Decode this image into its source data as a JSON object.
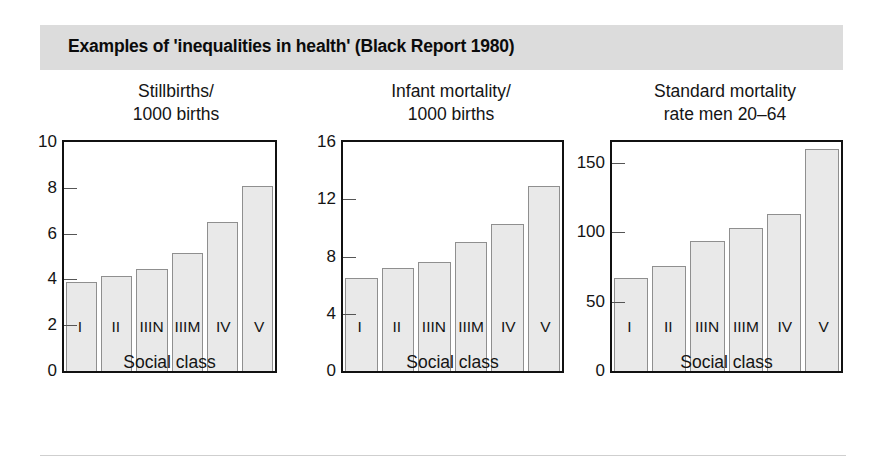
{
  "header": {
    "title": "Examples of 'inequalities in health' (Black Report 1980)",
    "band_color": "#dcdcdc"
  },
  "axis_caption": "Social class",
  "chart_data": [
    {
      "type": "bar",
      "title": "Stillbirths/\n1000 births",
      "title_line1": "Stillbirths/",
      "title_line2": "1000 births",
      "xlabel": "Social class",
      "ylabel": "",
      "categories": [
        "I",
        "II",
        "IIIN",
        "IIIM",
        "IV",
        "V"
      ],
      "values": [
        3.9,
        4.15,
        4.45,
        5.15,
        6.5,
        8.1
      ],
      "ylim": [
        0,
        10
      ],
      "yticks": [
        0,
        2,
        4,
        6,
        8,
        10
      ],
      "ytick_labels": [
        "0",
        "2",
        "4",
        "6",
        "8",
        "10"
      ],
      "grid": false,
      "legend": "none",
      "bar_fill": "#e9e9e9",
      "bar_border": "#8f8f8f"
    },
    {
      "type": "bar",
      "title": "Infant mortality/\n1000 births",
      "title_line1": "Infant mortality/",
      "title_line2": "1000 births",
      "xlabel": "Social class",
      "ylabel": "",
      "categories": [
        "I",
        "II",
        "IIIN",
        "IIIM",
        "IV",
        "V"
      ],
      "values": [
        6.5,
        7.2,
        7.6,
        9.0,
        10.3,
        12.9
      ],
      "ylim": [
        0,
        16
      ],
      "yticks": [
        0,
        4,
        8,
        12,
        16
      ],
      "ytick_labels": [
        "0",
        "4",
        "8",
        "12",
        "16"
      ],
      "grid": false,
      "legend": "none",
      "bar_fill": "#e9e9e9",
      "bar_border": "#8f8f8f"
    },
    {
      "type": "bar",
      "title": "Standard mortality\nrate men 20–64",
      "title_line1": "Standard mortality",
      "title_line2": "rate men 20–64",
      "xlabel": "Social class",
      "ylabel": "",
      "categories": [
        "I",
        "II",
        "IIIN",
        "IIIM",
        "IV",
        "V"
      ],
      "values": [
        67,
        76,
        94,
        103,
        113,
        160
      ],
      "ylim": [
        0,
        165
      ],
      "yticks": [
        0,
        50,
        100,
        150
      ],
      "ytick_labels": [
        "0",
        "50",
        "100",
        "150"
      ],
      "grid": false,
      "legend": "none",
      "bar_fill": "#e9e9e9",
      "bar_border": "#8f8f8f"
    }
  ]
}
